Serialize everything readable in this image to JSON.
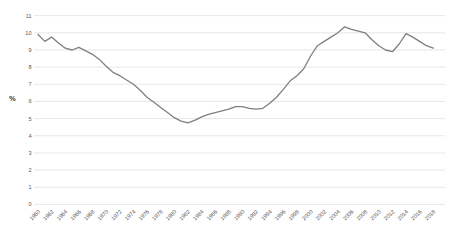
{
  "page": {
    "background_color": "#ffffff"
  },
  "chart_data": {
    "type": "line",
    "title": "",
    "xlabel": "",
    "ylabel": "%",
    "ylim": [
      0,
      11
    ],
    "y_tick_interval": 1,
    "x_tick_interval": 2,
    "grid": "horizontal",
    "legend": "none",
    "line_color": "#7f7f7f",
    "grid_color": "#dcdcdc",
    "tick_label_color": "#595959",
    "x": [
      1960,
      1961,
      1962,
      1963,
      1964,
      1965,
      1966,
      1967,
      1968,
      1969,
      1970,
      1971,
      1972,
      1973,
      1974,
      1975,
      1976,
      1977,
      1978,
      1979,
      1980,
      1981,
      1982,
      1983,
      1984,
      1985,
      1986,
      1987,
      1988,
      1989,
      1990,
      1991,
      1992,
      1993,
      1994,
      1995,
      1996,
      1997,
      1998,
      1999,
      2000,
      2001,
      2002,
      2003,
      2004,
      2005,
      2006,
      2007,
      2008,
      2009,
      2010,
      2011,
      2012,
      2013,
      2014,
      2015,
      2016,
      2017,
      2018
    ],
    "values": [
      9.9,
      9.5,
      9.75,
      9.4,
      9.1,
      9.0,
      9.15,
      8.95,
      8.75,
      8.45,
      8.05,
      7.7,
      7.5,
      7.25,
      7.0,
      6.65,
      6.25,
      5.95,
      5.65,
      5.35,
      5.05,
      4.85,
      4.75,
      4.9,
      5.1,
      5.25,
      5.35,
      5.45,
      5.55,
      5.7,
      5.7,
      5.6,
      5.55,
      5.6,
      5.9,
      6.25,
      6.7,
      7.2,
      7.5,
      7.9,
      8.65,
      9.25,
      9.5,
      9.75,
      10.0,
      10.35,
      10.2,
      10.1,
      10.0,
      9.6,
      9.25,
      9.0,
      8.9,
      9.35,
      9.95,
      9.75,
      9.5,
      9.25,
      9.1
    ],
    "y_tick_labels": [
      "0",
      "1",
      "2",
      "3",
      "4",
      "5",
      "6",
      "7",
      "8",
      "9",
      "10",
      "11"
    ],
    "x_tick_labels": [
      "1960",
      "1962",
      "1964",
      "1966",
      "1968",
      "1970",
      "1972",
      "1974",
      "1976",
      "1978",
      "1980",
      "1982",
      "1984",
      "1986",
      "1988",
      "1990",
      "1992",
      "1994",
      "1996",
      "1998",
      "2000",
      "2002",
      "2004",
      "2006",
      "2008",
      "2010",
      "2012",
      "2014",
      "2016",
      "2018"
    ]
  }
}
